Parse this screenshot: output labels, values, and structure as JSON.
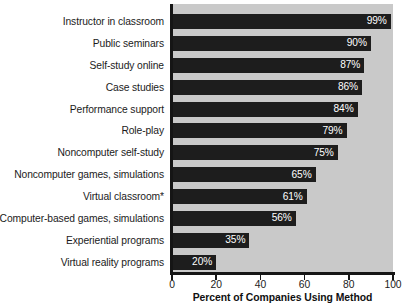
{
  "chart_data": {
    "type": "bar",
    "orientation": "horizontal",
    "title": "",
    "xlabel": "Percent of Companies Using Method",
    "ylabel": "",
    "xlim": [
      0,
      100
    ],
    "xticks": [
      0,
      20,
      40,
      60,
      80,
      100
    ],
    "grid": false,
    "legend": null,
    "bar_color": "#1d1d1d",
    "plot_background": "#c9c9c9",
    "value_label_color": "#ffffff",
    "categories": [
      "Instructor in classroom",
      "Public seminars",
      "Self-study online",
      "Case studies",
      "Performance support",
      "Role-play",
      "Noncomputer self-study",
      "Noncomputer games, simulations",
      "Virtual classroom*",
      "Computer-based games, simulations",
      "Experiential programs",
      "Virtual reality programs"
    ],
    "values": [
      99,
      90,
      87,
      86,
      84,
      79,
      75,
      65,
      61,
      56,
      35,
      20
    ],
    "value_labels": [
      "99%",
      "90%",
      "87%",
      "86%",
      "84%",
      "79%",
      "75%",
      "65%",
      "61%",
      "56%",
      "35%",
      "20%"
    ],
    "tick_labels": [
      "0",
      "20",
      "40",
      "60",
      "80",
      "100"
    ]
  }
}
